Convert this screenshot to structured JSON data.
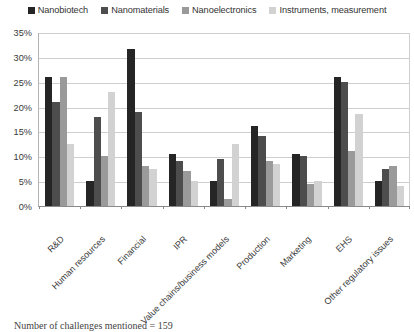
{
  "chart_data": {
    "type": "bar",
    "title": "",
    "subtitle": "",
    "xlabel": "",
    "ylabel": "",
    "ylim": [
      0,
      35
    ],
    "ytick_labels": [
      "0%",
      "5%",
      "10%",
      "15%",
      "20%",
      "25%",
      "30%",
      "35%"
    ],
    "ytick_values": [
      0,
      5,
      10,
      15,
      20,
      25,
      30,
      35
    ],
    "grid": true,
    "legend_position": "top",
    "categories": [
      "R&D",
      "Human resources",
      "Financial",
      "IPR",
      "Value chains/business models",
      "Production",
      "Marketing",
      "EHS",
      "Other regulatory issues"
    ],
    "series": [
      {
        "name": "Nanobiotech",
        "color": "#252525",
        "values": [
          26,
          5,
          31.5,
          10.5,
          5,
          16,
          10.5,
          26,
          5
        ]
      },
      {
        "name": "Nanomaterials",
        "color": "#4d4d4d",
        "values": [
          21,
          18,
          19,
          9,
          9.5,
          14,
          10,
          25,
          7.5
        ]
      },
      {
        "name": "Nanoelectronics",
        "color": "#9a9a9a",
        "values": [
          26,
          10,
          8,
          7,
          1.5,
          9,
          4.5,
          11,
          8
        ]
      },
      {
        "name": "Instruments, measurement",
        "color": "#d2d2d2",
        "values": [
          12.5,
          23,
          7.5,
          5,
          12.5,
          8.5,
          5,
          18.5,
          4
        ]
      }
    ],
    "footnote": "Number of challenges mentioned = 159"
  },
  "legend": {
    "items": [
      {
        "label": "Nanobiotech"
      },
      {
        "label": "Nanomaterials"
      },
      {
        "label": "Nanoelectronics"
      },
      {
        "label": "Instruments, measurement"
      }
    ]
  },
  "footnote": {
    "text": "Number of challenges mentioned = 159"
  }
}
